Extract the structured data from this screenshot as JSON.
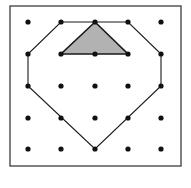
{
  "figure": {
    "title": "Geoboard with shaded triangle inside a heptagon",
    "caption": "",
    "canvas": {
      "width": 191,
      "height": 188,
      "background": "#ffffff"
    },
    "frame": {
      "label": "geoboard-frame",
      "x": 10,
      "y": 6,
      "width": 171,
      "height": 160,
      "stroke": "#4a4a4a",
      "stroke_width": 1.4,
      "fill": "#ffffff"
    },
    "grid": {
      "label": "peg-grid",
      "rows": 5,
      "cols": 5,
      "x_positions": [
        28,
        61,
        95,
        128,
        161
      ],
      "y_positions": [
        22,
        54,
        86,
        118,
        149
      ],
      "dot_radius": 2.6,
      "dot_color": "#111111",
      "points": [
        {
          "col": 0,
          "row": 0,
          "cx": 28,
          "cy": 22
        },
        {
          "col": 1,
          "row": 0,
          "cx": 61,
          "cy": 22
        },
        {
          "col": 2,
          "row": 0,
          "cx": 95,
          "cy": 22
        },
        {
          "col": 3,
          "row": 0,
          "cx": 128,
          "cy": 22
        },
        {
          "col": 4,
          "row": 0,
          "cx": 161,
          "cy": 22
        },
        {
          "col": 0,
          "row": 1,
          "cx": 28,
          "cy": 54
        },
        {
          "col": 1,
          "row": 1,
          "cx": 61,
          "cy": 54
        },
        {
          "col": 2,
          "row": 1,
          "cx": 95,
          "cy": 54
        },
        {
          "col": 3,
          "row": 1,
          "cx": 128,
          "cy": 54
        },
        {
          "col": 4,
          "row": 1,
          "cx": 161,
          "cy": 54
        },
        {
          "col": 0,
          "row": 2,
          "cx": 28,
          "cy": 86
        },
        {
          "col": 1,
          "row": 2,
          "cx": 61,
          "cy": 86
        },
        {
          "col": 2,
          "row": 2,
          "cx": 95,
          "cy": 86
        },
        {
          "col": 3,
          "row": 2,
          "cx": 128,
          "cy": 86
        },
        {
          "col": 4,
          "row": 2,
          "cx": 161,
          "cy": 86
        },
        {
          "col": 0,
          "row": 3,
          "cx": 28,
          "cy": 118
        },
        {
          "col": 1,
          "row": 3,
          "cx": 61,
          "cy": 118
        },
        {
          "col": 2,
          "row": 3,
          "cx": 95,
          "cy": 118
        },
        {
          "col": 3,
          "row": 3,
          "cx": 128,
          "cy": 118
        },
        {
          "col": 4,
          "row": 3,
          "cx": 161,
          "cy": 118
        },
        {
          "col": 0,
          "row": 4,
          "cx": 28,
          "cy": 149
        },
        {
          "col": 1,
          "row": 4,
          "cx": 61,
          "cy": 149
        },
        {
          "col": 2,
          "row": 4,
          "cx": 95,
          "cy": 149
        },
        {
          "col": 3,
          "row": 4,
          "cx": 128,
          "cy": 149
        },
        {
          "col": 4,
          "row": 4,
          "cx": 161,
          "cy": 149
        }
      ]
    },
    "shapes": [
      {
        "label": "outer-heptagon",
        "kind": "polygon",
        "vertex_count": 7,
        "vertices": [
          [
            61,
            22
          ],
          [
            128,
            22
          ],
          [
            161,
            54
          ],
          [
            161,
            86
          ],
          [
            95,
            149
          ],
          [
            28,
            86
          ],
          [
            28,
            54
          ]
        ],
        "points_attr": "61,22 128,22 161,54 161,86 95,149 28,86 28,54",
        "fill": "none",
        "stroke": "#1a1a1a",
        "stroke_width": 1.1
      },
      {
        "label": "shaded-triangle",
        "kind": "polygon",
        "vertex_count": 3,
        "vertices": [
          [
            95,
            22
          ],
          [
            128,
            54
          ],
          [
            61,
            54
          ]
        ],
        "points_attr": "95,22 128,54 61,54",
        "fill": "#b2b2b2",
        "stroke": "#1a1a1a",
        "stroke_width": 1.6
      }
    ]
  }
}
